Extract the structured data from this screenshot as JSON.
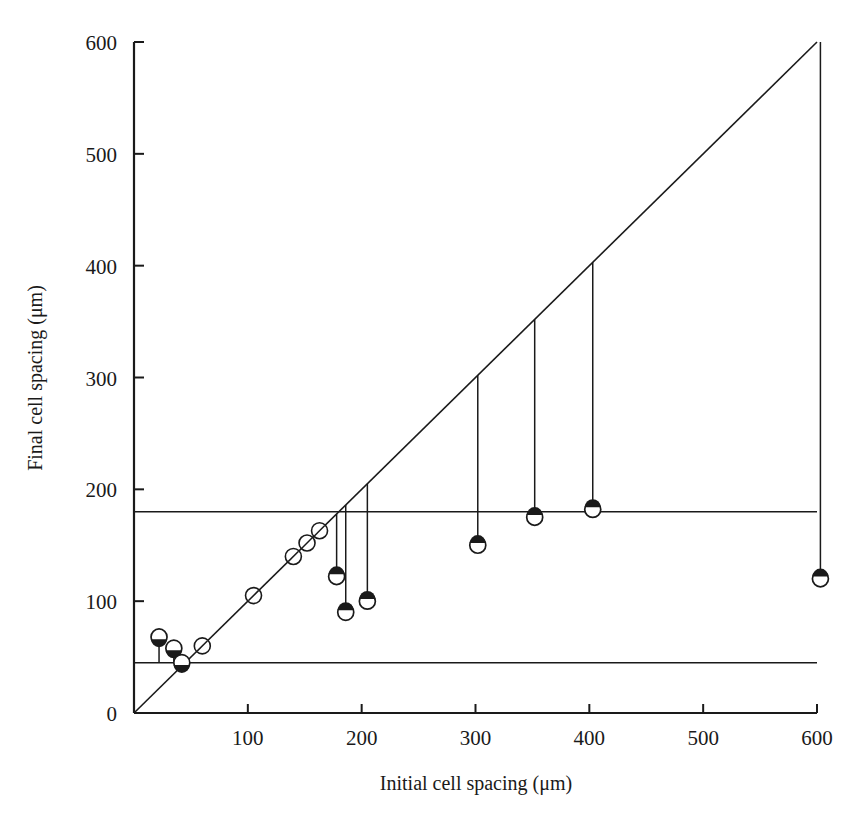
{
  "chart_data": {
    "type": "scatter",
    "title": "",
    "xlabel": "Initial cell spacing (μm)",
    "ylabel": "Final cell spacing (μm)",
    "xlim": [
      0,
      600
    ],
    "ylim": [
      0,
      600
    ],
    "xticks": [
      0,
      100,
      200,
      300,
      400,
      500,
      600
    ],
    "yticks": [
      0,
      100,
      200,
      300,
      400,
      500,
      600
    ],
    "xtick_labels": [
      "0",
      "100",
      "200",
      "300",
      "400",
      "500",
      "600"
    ],
    "ytick_labels": [
      "0",
      "100",
      "200",
      "300",
      "400",
      "500",
      "600"
    ],
    "grid": false,
    "legend": "none",
    "reference_lines": [
      {
        "name": "identity-line",
        "type": "diagonal",
        "from": [
          0,
          0
        ],
        "to": [
          600,
          600
        ],
        "note": "y = x"
      },
      {
        "name": "upper-plateau-line",
        "type": "horizontal",
        "y": 180,
        "x_from": 0,
        "x_to": 600
      },
      {
        "name": "lower-plateau-line",
        "type": "horizontal",
        "y": 45,
        "x_from": 0,
        "x_to": 600
      }
    ],
    "series": [
      {
        "name": "unchanged-spacing",
        "marker": "open-circle-slashed",
        "points": [
          {
            "x": 60,
            "y": 60
          },
          {
            "x": 105,
            "y": 105
          },
          {
            "x": 140,
            "y": 140
          },
          {
            "x": 152,
            "y": 152
          },
          {
            "x": 163,
            "y": 163
          }
        ]
      },
      {
        "name": "increased-spacing",
        "marker": "filled-circle-with-up-arrow",
        "points": [
          {
            "x": 22,
            "y": 68,
            "from_y": 45
          },
          {
            "x": 35,
            "y": 58,
            "from_y": 45
          },
          {
            "x": 42,
            "y": 45,
            "from_y": 45
          }
        ]
      },
      {
        "name": "decreased-spacing",
        "marker": "filled-circle-with-down-arrow",
        "points": [
          {
            "x": 178,
            "y": 122,
            "from_y": 178
          },
          {
            "x": 186,
            "y": 90,
            "from_y": 186
          },
          {
            "x": 205,
            "y": 100,
            "from_y": 205
          },
          {
            "x": 302,
            "y": 150,
            "from_y": 302
          },
          {
            "x": 352,
            "y": 175,
            "from_y": 352
          },
          {
            "x": 403,
            "y": 182,
            "from_y": 403
          },
          {
            "x": 603,
            "y": 120,
            "from_y": 600
          }
        ]
      }
    ]
  },
  "colors": {
    "ink": "#1a1a1a",
    "background": "#ffffff"
  }
}
